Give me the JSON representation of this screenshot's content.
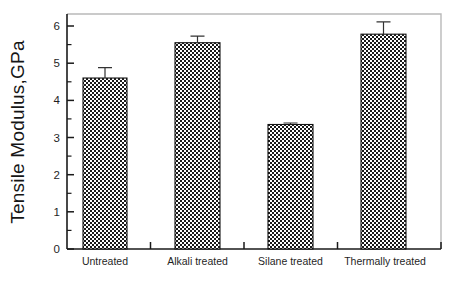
{
  "chart_data": {
    "type": "bar",
    "title": "",
    "subtitle": "",
    "xlabel": "",
    "ylabel": "Tensile Modulus,GPa",
    "categories": [
      "Untreated",
      "Alkali treated",
      "Silane treated",
      "Thermally treated"
    ],
    "values": [
      4.6,
      5.55,
      3.35,
      5.78
    ],
    "errors": [
      0.28,
      0.18,
      0.04,
      0.33
    ],
    "series": [
      {
        "name": "Tensile Modulus",
        "values": [
          4.6,
          5.55,
          3.35,
          5.78
        ],
        "errors": [
          0.28,
          0.18,
          0.04,
          0.33
        ]
      }
    ],
    "ylim": [
      0,
      6.5
    ],
    "xlim": [
      0,
      4
    ],
    "ytick_labels": [
      "0",
      "1",
      "2",
      "3",
      "4",
      "5",
      "6"
    ],
    "ytick_values": [
      0,
      1,
      2,
      3,
      4,
      5,
      6
    ],
    "yminor_values": [
      0.5,
      1.5,
      2.5,
      3.5,
      4.5,
      5.5
    ],
    "grid": false,
    "legend": false,
    "legend_position": "none",
    "bar_fill_pattern": "checkerboard",
    "bar_fill_color": "#ffffff",
    "bar_pattern_color": "#1a1a1a",
    "axis_color": "#1a1a1a",
    "frame_color": "#b9b9b9",
    "background_color": "#ffffff",
    "annotations": []
  }
}
